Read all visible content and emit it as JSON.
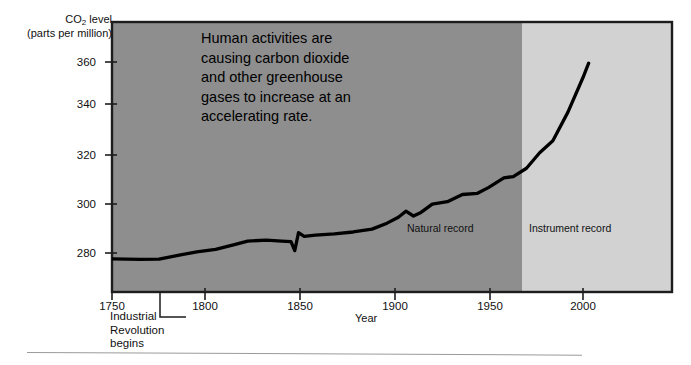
{
  "chart_data": {
    "type": "line",
    "title": "",
    "ylabel": "CO2 level (parts per million)",
    "ylabel_line1": "CO",
    "ylabel_sub": "2",
    "ylabel_line1_rest": " level",
    "ylabel_line2": "(parts per million)",
    "xlabel": "Year",
    "xlim": [
      1740,
      2035
    ],
    "ylim": [
      268,
      368
    ],
    "yticks": [
      280,
      300,
      320,
      340,
      360
    ],
    "xticks": [
      1750,
      1800,
      1850,
      1900,
      1950,
      2000
    ],
    "grid": false,
    "legend": null,
    "line_color": "#000000",
    "line_width": 3.2,
    "plot_bg_natural": "#8e8e8e",
    "plot_bg_instrument": "#d2d2d2",
    "regions": [
      {
        "name": "Natural record",
        "x_start": 1740,
        "x_end": 1958,
        "color": "#8e8e8e"
      },
      {
        "name": "Instrument record",
        "x_start": 1958,
        "x_end": 2035,
        "color": "#d2d2d2"
      }
    ],
    "annotation": "Human activities are causing carbon dioxide and other greenhouse gases to increase at an accelerating rate.",
    "annotation_lines": [
      "Human activities are",
      "causing carbon dioxide",
      "and other greenhouse",
      "gases to increase at an",
      "accelerating rate."
    ],
    "callout": "Industrial Revolution begins",
    "callout_lines": [
      "Industrial",
      "Revolution",
      "begins"
    ],
    "callout_year": 1775,
    "series": [
      {
        "name": "CO2 concentration",
        "x": [
          1750,
          1765,
          1775,
          1785,
          1795,
          1805,
          1815,
          1822,
          1832,
          1840,
          1845,
          1847,
          1849,
          1852,
          1858,
          1868,
          1878,
          1888,
          1896,
          1902,
          1906,
          1910,
          1914,
          1920,
          1928,
          1936,
          1944,
          1950,
          1958,
          1963,
          1970,
          1977,
          1984,
          1992,
          2000,
          2003
        ],
        "y": [
          277.5,
          277.3,
          277.4,
          279.0,
          280.5,
          281.5,
          283.5,
          285.0,
          285.4,
          285.0,
          284.8,
          281.0,
          288.5,
          287.0,
          287.5,
          288.0,
          288.8,
          290.0,
          292.5,
          295.0,
          297.5,
          295.5,
          297.0,
          300.5,
          301.5,
          304.5,
          305.0,
          307.5,
          311.5,
          312.0,
          315.5,
          322.0,
          327.0,
          339.0,
          353.5,
          359.5
        ]
      }
    ]
  },
  "axis": {
    "y_ticks": [
      {
        "value": "360",
        "top": 56
      },
      {
        "value": "340",
        "top": 98
      },
      {
        "value": "320",
        "top": 149
      },
      {
        "value": "300",
        "top": 198
      },
      {
        "value": "280",
        "top": 247
      }
    ],
    "x_ticks": [
      {
        "value": "1750",
        "left": 89
      },
      {
        "value": "1800",
        "left": 182
      },
      {
        "value": "1850",
        "left": 277
      },
      {
        "value": "1900",
        "left": 372
      },
      {
        "value": "1950",
        "left": 467
      },
      {
        "value": "2000",
        "left": 560
      }
    ],
    "x_title": "Year"
  },
  "labels": {
    "natural_record": "Natural record",
    "instrument_record": "Instrument record",
    "industrial_note": "Industrial\nRevolution\nbegins"
  }
}
